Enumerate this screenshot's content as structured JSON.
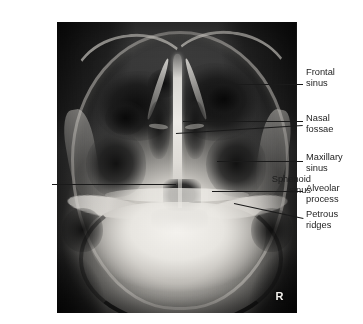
{
  "figure": {
    "modality": "radiograph",
    "view": "Paranasal sinuses, Waters (occipitomental) projection",
    "film_marker": "R",
    "plate": {
      "x": 57,
      "y": 22,
      "width": 240,
      "height": 291
    },
    "background_color": "#ffffff",
    "label_color": "#1d1d1d",
    "leader_color": "#1a1a1a"
  },
  "annotations": [
    {
      "id": "frontal-sinus",
      "lines": [
        "Frontal",
        "sinus"
      ],
      "side": "right",
      "label_x": 306,
      "label_y": 67,
      "leader": {
        "x1": 203,
        "y1": 84,
        "x2": 303,
        "y2": 84
      }
    },
    {
      "id": "nasal-fossae",
      "lines": [
        "Nasal",
        "fossae"
      ],
      "side": "right",
      "label_x": 306,
      "label_y": 113,
      "leader": {
        "x1": 183,
        "y1": 121,
        "x2": 303,
        "y2": 121
      },
      "leader2": {
        "x1": 176,
        "y1": 133,
        "x2": 303,
        "y2": 125
      }
    },
    {
      "id": "maxillary-sinus",
      "lines": [
        "Maxillary",
        "sinus"
      ],
      "side": "right",
      "label_x": 306,
      "label_y": 152,
      "leader": {
        "x1": 217,
        "y1": 161,
        "x2": 303,
        "y2": 161
      }
    },
    {
      "id": "alveolar-process",
      "lines": [
        "Alveolar",
        "process"
      ],
      "side": "right",
      "label_x": 306,
      "label_y": 183,
      "leader": {
        "x1": 212,
        "y1": 191,
        "x2": 303,
        "y2": 191
      }
    },
    {
      "id": "petrous-ridges",
      "lines": [
        "Petrous",
        "ridges"
      ],
      "side": "right",
      "label_x": 306,
      "label_y": 209,
      "leader": {
        "x1": 234,
        "y1": 203,
        "x2": 303,
        "y2": 218
      }
    },
    {
      "id": "sphenoid-sinus",
      "lines": [
        "Sphenoid",
        "sinus"
      ],
      "side": "left",
      "label_right": 311,
      "label_y": 174,
      "leader": {
        "x1": 52,
        "y1": 184,
        "x2": 176,
        "y2": 184
      }
    }
  ]
}
